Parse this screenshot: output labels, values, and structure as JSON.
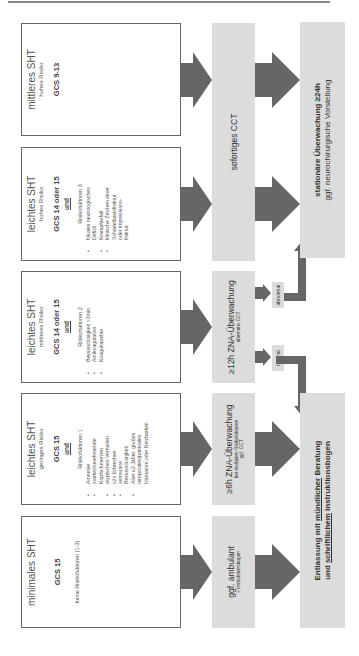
{
  "colors": {
    "box_border": "#666666",
    "grey_fill": "#dcdcdc",
    "arrow": "#666666"
  },
  "categories": [
    {
      "title": "minimales SHT",
      "risk": "",
      "gcs": "GCS 15",
      "connector": "",
      "note": "keine Risikofaktoren (1-3)",
      "risk_factors_heading": "",
      "risk_factors": []
    },
    {
      "title": "leichtes SHT",
      "risk": "geringes Risiko",
      "gcs": "GCS 15",
      "connector": "und",
      "note": "",
      "risk_factors_heading": "Risikofaktoren 1",
      "risk_factors": [
        "Amnesie",
        "starke/zunehmende",
        "Kopfschmerzen",
        "atypisches Verhalten",
        "≥2x Erbrechen",
        "vermutete",
        "Bewusstlosigkeit",
        "Alter ≤2 Jahre: großes",
        "temporales/parietales",
        "Hämatom oder Reizbarkeit"
      ]
    },
    {
      "title": "leichtes SHT",
      "risk": "mittleres Risiko",
      "gcs": "GCS 14 oder 15",
      "connector": "und",
      "note": "",
      "risk_factors_heading": "Risikofaktoren 2",
      "risk_factors": [
        "Bewusstlosigkeit >1min",
        "Antikoagulation",
        "Koagulopathie"
      ]
    },
    {
      "title": "leichtes SHT",
      "risk": "hohes Risiko",
      "gcs": "GCS 14 oder 15",
      "connector": "und",
      "note": "",
      "risk_factors_heading": "Risikofaktoren 3",
      "risk_factors": [
        "fokales neurologisches",
        "Defizit",
        "Krampfanfall",
        "klinische Zeichen einer",
        "Schädelbasisfraktur",
        "oder Impressions-",
        "fraktur"
      ]
    },
    {
      "title": "mittleres SHT",
      "risk": "hohes Risiko",
      "gcs": "GCS 9-13",
      "connector": "",
      "note": "",
      "risk_factors_heading": "",
      "risk_factors": []
    }
  ],
  "actions": {
    "ambulant": {
      "main": "ggf. ambulant",
      "sub": "+ Instruktionsbogen"
    },
    "zna6h": {
      "main": "≥6h ZNA-Überwachung",
      "sub1": "bei multiplen Risikofaktoren",
      "sub2": "ggf. CCT"
    },
    "zna12h": {
      "main": "≥12h ZNA-Überwachung",
      "sub": "alternativ CCT"
    },
    "cct": {
      "main": "sofortiges CCT"
    }
  },
  "results": {
    "normal": "normal",
    "abnormal": "abnormal"
  },
  "outcomes": {
    "discharge": {
      "line1_a": "Entlassung mit ",
      "line1_b": "mündlicher",
      "line1_c": " Beratung",
      "line2_a": "und ",
      "line2_b": "schriftlichem",
      "line2_c": " Instruktionsbogen"
    },
    "inpatient": {
      "line1": "stationäre Überwachung ≥24h",
      "line2": "ggf. neurochirurgische Vorstellung"
    }
  }
}
